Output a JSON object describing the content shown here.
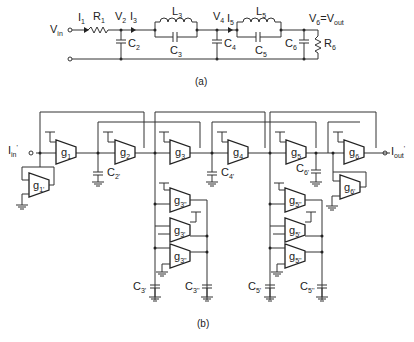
{
  "figure_a": {
    "caption": "(a)",
    "labels": {
      "vin": "V",
      "vin_sub": "in",
      "i1": "I",
      "i1_sub": "1",
      "r1": "R",
      "r1_sub": "1",
      "v2": "V",
      "v2_sub": "2",
      "i3": "I",
      "i3_sub": "3",
      "l3": "L",
      "l3_sub": "3",
      "c2": "C",
      "c2_sub": "2",
      "c3": "C",
      "c3_sub": "3",
      "v4": "V",
      "v4_sub": "4",
      "i5": "I",
      "i5_sub": "5",
      "l5": "L",
      "l5_sub": "5",
      "c4": "C",
      "c4_sub": "4",
      "c5": "C",
      "c5_sub": "5",
      "v6": "V",
      "v6_sub": "6",
      "eq": "=V",
      "vout_sub": "out",
      "c6": "C",
      "c6_sub": "6",
      "r6": "R",
      "r6_sub": "6"
    }
  },
  "figure_b": {
    "caption": "(b)",
    "input_label": "I",
    "input_sub": "in",
    "input_prime": "'",
    "output_label": "I",
    "output_sub": "out",
    "output_prime": "'",
    "otas": [
      {
        "id": "g1",
        "label": "g",
        "sub": "1"
      },
      {
        "id": "g2",
        "label": "g",
        "sub": "2"
      },
      {
        "id": "g3",
        "label": "g",
        "sub": "3"
      },
      {
        "id": "g4",
        "label": "g",
        "sub": "4"
      },
      {
        "id": "g5",
        "label": "g",
        "sub": "5"
      },
      {
        "id": "g6",
        "label": "g",
        "sub": "6"
      },
      {
        "id": "g1p",
        "label": "g",
        "sub": "1'"
      },
      {
        "id": "g6p",
        "label": "g",
        "sub": "6'"
      },
      {
        "id": "g3pp_top",
        "label": "g",
        "sub": "3''"
      },
      {
        "id": "g3p",
        "label": "g",
        "sub": "3'"
      },
      {
        "id": "g3pp_bot",
        "label": "g",
        "sub": "3''"
      },
      {
        "id": "g5pp_top",
        "label": "g",
        "sub": "5''"
      },
      {
        "id": "g5p",
        "label": "g",
        "sub": "5'"
      },
      {
        "id": "g5pp_bot",
        "label": "g",
        "sub": "5''"
      }
    ],
    "capacitors": {
      "c2p": {
        "label": "C",
        "sub": "2'"
      },
      "c4p": {
        "label": "C",
        "sub": "4'"
      },
      "c6p": {
        "label": "C",
        "sub": "6'"
      },
      "c3p": {
        "label": "C",
        "sub": "3'"
      },
      "c3pp": {
        "label": "C",
        "sub": "3''"
      },
      "c5p": {
        "label": "C",
        "sub": "5'"
      },
      "c5pp": {
        "label": "C",
        "sub": "5''"
      }
    }
  }
}
